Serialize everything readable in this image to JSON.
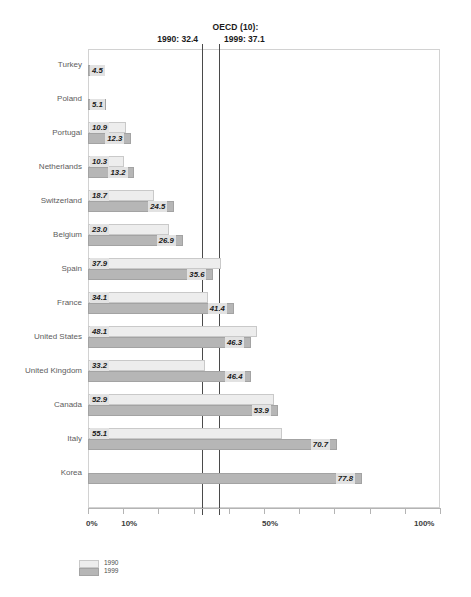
{
  "reference": {
    "title": "OECD (10):",
    "line_1990_label": "1990: 32.4",
    "line_1999_label": "1999: 37.1",
    "value_1990": 32.4,
    "value_1999": 37.1,
    "line_color": "#4a4a4a"
  },
  "axis": {
    "tick_labels": [
      "0%",
      "10%",
      "50%",
      "100%"
    ],
    "tick_values": [
      0,
      10,
      50,
      100
    ],
    "all_ticks": [
      0,
      10,
      20,
      30,
      40,
      50,
      60,
      70,
      80,
      90,
      100
    ]
  },
  "legend": {
    "items": [
      {
        "label": "1990",
        "color": "#ededed"
      },
      {
        "label": "1999",
        "color": "#b6b6b6"
      }
    ]
  },
  "chart_data": {
    "type": "bar",
    "orientation": "horizontal",
    "title": "OECD (10):",
    "xlabel": "",
    "ylabel": "",
    "xlim": [
      0,
      100
    ],
    "grid": false,
    "legend_position": "bottom-left",
    "categories": [
      "Turkey",
      "Poland",
      "Portugal",
      "Netherlands",
      "Switzerland",
      "Belgium",
      "Spain",
      "France",
      "United States",
      "United Kingdom",
      "Canada",
      "Italy",
      "Korea"
    ],
    "series": [
      {
        "name": "1990",
        "color": "#ededed",
        "values": [
          null,
          null,
          10.9,
          10.3,
          18.7,
          23.0,
          37.9,
          34.1,
          48.1,
          33.2,
          52.9,
          55.1,
          null
        ]
      },
      {
        "name": "1999",
        "color": "#b6b6b6",
        "values": [
          4.5,
          5.1,
          12.3,
          13.2,
          24.5,
          26.9,
          35.6,
          41.4,
          46.3,
          46.4,
          53.9,
          70.7,
          77.8
        ]
      }
    ],
    "reference_lines": [
      {
        "label": "1990: 32.4",
        "value": 32.4
      },
      {
        "label": "1999: 37.1",
        "value": 37.1
      }
    ]
  }
}
